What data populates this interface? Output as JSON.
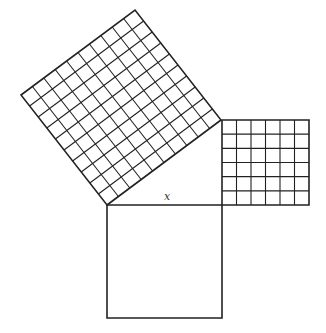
{
  "diagram": {
    "type": "pythagorean-theorem-squares",
    "label_x": "x",
    "line_color": "#222222",
    "background": "#ffffff",
    "triangle": {
      "right_angle_vertex": [
        222,
        205
      ],
      "bottom_left_vertex": [
        107,
        205
      ],
      "top_right_vertex": [
        222,
        120
      ]
    },
    "squares": [
      {
        "name": "hypotenuse-square",
        "grid": 10,
        "corners": [
          [
            107,
            205
          ],
          [
            221,
            120
          ],
          [
            135,
            10
          ],
          [
            21,
            95
          ]
        ]
      },
      {
        "name": "leg-square-small",
        "grid": 6,
        "x": 222,
        "y": 120,
        "w": 87,
        "h": 85
      },
      {
        "name": "leg-square-unknown",
        "grid": 0,
        "x": 107,
        "y": 205,
        "w": 115,
        "h": 113
      }
    ]
  }
}
